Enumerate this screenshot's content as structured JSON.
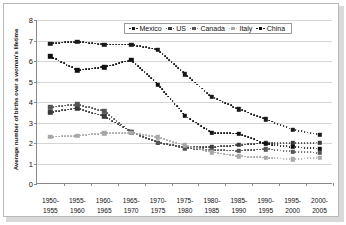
{
  "chart_data": {
    "type": "line",
    "title": "",
    "xlabel": "",
    "ylabel": "Average number of births over a woman's lifetime",
    "ylim": [
      0,
      8
    ],
    "yticks": [
      0,
      1,
      2,
      3,
      4,
      5,
      6,
      7,
      8
    ],
    "grid": true,
    "legend_position": "top-center",
    "categories": [
      "1950-\n1955",
      "1955-\n1960",
      "1960-\n1965",
      "1965-\n1970",
      "1970-\n1975",
      "1975-\n1980",
      "1980-\n1985",
      "1985-\n1990",
      "1990-\n1995",
      "1995-\n2000",
      "2000-\n2005"
    ],
    "category_lines": [
      [
        "1950-",
        "1955"
      ],
      [
        "1955-",
        "1960"
      ],
      [
        "1960-",
        "1965"
      ],
      [
        "1965-",
        "1970"
      ],
      [
        "1970-",
        "1975"
      ],
      [
        "1975-",
        "1980"
      ],
      [
        "1980-",
        "1985"
      ],
      [
        "1985-",
        "1990"
      ],
      [
        "1990-",
        "1995"
      ],
      [
        "1995-",
        "2000"
      ],
      [
        "2000-",
        "2005"
      ]
    ],
    "series": [
      {
        "name": "Mexico",
        "color": "#1a1a1a",
        "values": [
          6.85,
          6.95,
          6.8,
          6.8,
          6.55,
          5.35,
          4.25,
          3.65,
          3.15,
          2.65,
          2.4
        ]
      },
      {
        "name": "US",
        "color": "#3a3a3a",
        "values": [
          3.5,
          3.7,
          3.3,
          2.55,
          2.02,
          1.78,
          1.8,
          1.9,
          2.0,
          1.98,
          2.02
        ]
      },
      {
        "name": "Canada",
        "color": "#555555",
        "values": [
          3.75,
          3.88,
          3.55,
          2.52,
          2.02,
          1.75,
          1.65,
          1.62,
          1.7,
          1.58,
          1.52
        ]
      },
      {
        "name": "Italy",
        "color": "#a8a8a8",
        "values": [
          2.3,
          2.35,
          2.48,
          2.5,
          2.28,
          1.88,
          1.55,
          1.35,
          1.28,
          1.2,
          1.28
        ]
      },
      {
        "name": "China",
        "color": "#111111",
        "values": [
          6.22,
          5.55,
          5.7,
          6.05,
          4.85,
          3.32,
          2.5,
          2.45,
          1.95,
          1.8,
          1.72
        ]
      }
    ]
  },
  "legend": {
    "items": [
      {
        "label": "Mexico",
        "color": "#1a1a1a"
      },
      {
        "label": "US",
        "color": "#3a3a3a"
      },
      {
        "label": "Canada",
        "color": "#555555"
      },
      {
        "label": "Italy",
        "color": "#a8a8a8"
      },
      {
        "label": "China",
        "color": "#111111"
      }
    ]
  },
  "axis": {
    "y_title": "Average number of births over a woman's lifetime",
    "y_tick_labels": [
      "0",
      "1",
      "2",
      "3",
      "4",
      "5",
      "6",
      "7",
      "8"
    ]
  }
}
